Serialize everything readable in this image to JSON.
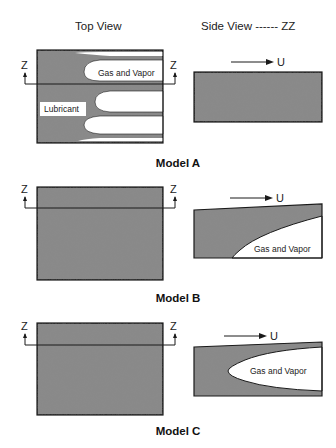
{
  "headers": {
    "top_view": "Top View",
    "side_view": "Side View ------ ZZ"
  },
  "models": [
    {
      "name": "Model A",
      "section_marker_left": "Z",
      "section_marker_right": "Z",
      "top_view_labels": {
        "gas": "Gas and Vapor",
        "lubricant": "Lubricant"
      },
      "side_view": {
        "velocity_label": "U",
        "gas_label": ""
      }
    },
    {
      "name": "Model B",
      "section_marker_left": "Z",
      "section_marker_right": "Z",
      "side_view": {
        "velocity_label": "U",
        "gas_label": "Gas and Vapor"
      }
    },
    {
      "name": "Model C",
      "section_marker_left": "Z",
      "section_marker_right": "Z",
      "side_view": {
        "velocity_label": "U",
        "gas_label": "Gas and Vapor"
      }
    }
  ],
  "colors": {
    "lubricant_fill": "#8a8a8a",
    "outline": "#1a1a1a",
    "background": "#ffffff"
  }
}
